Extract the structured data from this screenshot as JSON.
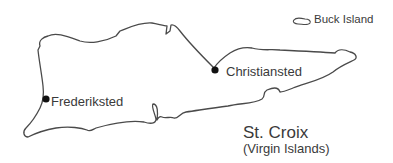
{
  "map": {
    "title": "St. Croix",
    "subtitle": "(Virgin Islands)",
    "outline_color": "#4a4a4a",
    "marker_color": "#111111",
    "text_color": "#3a3a3a",
    "islands": [
      {
        "name": "St. Croix"
      },
      {
        "name": "Buck Island",
        "label": "Buck Island"
      }
    ],
    "towns": [
      {
        "name": "Christiansted",
        "label": "Christiansted"
      },
      {
        "name": "Frederiksted",
        "label": "Frederiksted"
      }
    ]
  }
}
